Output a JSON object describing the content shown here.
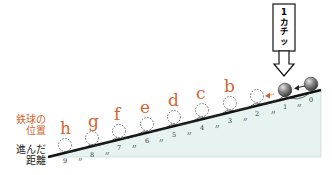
{
  "colors": {
    "accent": "#d2652f",
    "slope_fill": "#e6f3f1",
    "slope_line": "#111111",
    "ball": "#777777"
  },
  "labels": {
    "position_label_line1": "鉄球の",
    "position_label_line2": "位置",
    "distance_label_line1": "進んだ",
    "distance_label_line2": "距離"
  },
  "click_box": {
    "text_line1": "1",
    "text_line2": "カ",
    "text_line3": "チ",
    "text_line4": "ッ"
  },
  "positions": [
    {
      "letter": "b",
      "x": 232,
      "y": 82
    },
    {
      "letter": "c",
      "x": 203,
      "y": 89
    },
    {
      "letter": "d",
      "x": 174,
      "y": 96
    },
    {
      "letter": "e",
      "x": 146,
      "y": 103
    },
    {
      "letter": "f",
      "x": 118,
      "y": 109
    },
    {
      "letter": "g",
      "x": 93,
      "y": 115
    },
    {
      "letter": "h",
      "x": 66,
      "y": 122
    }
  ],
  "distance_marks": [
    "0",
    "1",
    "2",
    "3",
    "4",
    "5",
    "6",
    "7",
    "8",
    "9"
  ],
  "tick_mark": "〃"
}
